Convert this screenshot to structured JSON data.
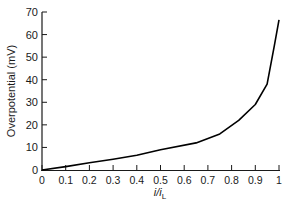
{
  "chart_data": {
    "type": "line",
    "title": "",
    "xlabel": "i/i_L",
    "xlabel_main": "i/i",
    "xlabel_sub": "L",
    "ylabel": "Overpotential (mV)",
    "xlim": [
      0,
      1
    ],
    "ylim": [
      0,
      70
    ],
    "xticks": [
      0,
      0.1,
      0.2,
      0.3,
      0.4,
      0.5,
      0.6,
      0.7,
      0.8,
      0.9,
      1
    ],
    "xtick_labels": [
      "0",
      "0.1",
      "0.2",
      "0.3",
      "0.4",
      "0.5",
      "0.6",
      "0.7",
      "0.8",
      "0.9",
      "1"
    ],
    "yticks": [
      0,
      10,
      20,
      30,
      40,
      50,
      60,
      70
    ],
    "ytick_labels": [
      "0",
      "10",
      "20",
      "30",
      "40",
      "50",
      "60",
      "70"
    ],
    "grid": false,
    "legend": null,
    "series": [
      {
        "name": "Overpotential",
        "color": "#000000",
        "x": [
          0,
          0.1,
          0.2,
          0.3,
          0.4,
          0.5,
          0.65,
          0.75,
          0.83,
          0.9,
          0.95,
          0.98,
          1.0
        ],
        "y": [
          0,
          1.5,
          3.2,
          4.8,
          6.5,
          9,
          12,
          16,
          22,
          29,
          38,
          55,
          66.5
        ]
      }
    ]
  }
}
